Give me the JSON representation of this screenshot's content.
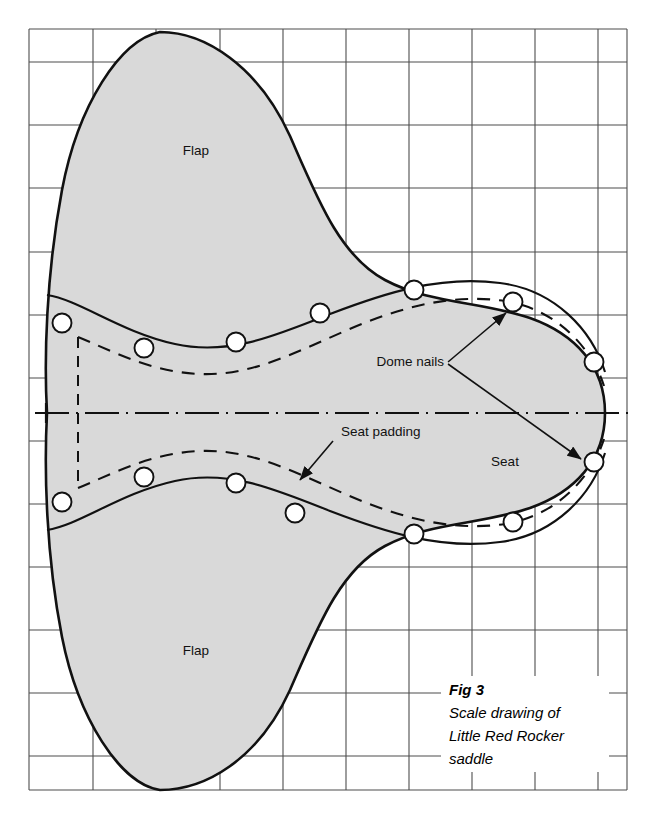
{
  "figure": {
    "caption_title": "Fig 3",
    "caption_lines": [
      "Scale drawing of",
      "Little Red Rocker",
      "saddle"
    ],
    "labels": {
      "flap_top": "Flap",
      "flap_bottom": "Flap",
      "seat": "Seat",
      "seat_padding": "Seat padding",
      "dome_nails": "Dome nails"
    },
    "colors": {
      "saddle_fill": "#d9d9d9",
      "outline": "#111111",
      "grid": "#4d4d4d",
      "text": "#111111",
      "background": "#ffffff"
    },
    "grid": {
      "x_lines": [
        29,
        93,
        156,
        220,
        283,
        346,
        409,
        472,
        535,
        598,
        627
      ],
      "y_lines": [
        29,
        62,
        125,
        188,
        252,
        315,
        378,
        441,
        504,
        567,
        630,
        693,
        756,
        790
      ],
      "left": 29,
      "right": 627,
      "top": 29,
      "bottom": 790,
      "cell_size": 63
    },
    "centerline_y": 413,
    "dome_nails": {
      "radius": 9,
      "count": 14,
      "upper": [
        {
          "cx": 62,
          "cy": 323
        },
        {
          "cx": 144,
          "cy": 348
        },
        {
          "cx": 236,
          "cy": 342
        },
        {
          "cx": 320,
          "cy": 313
        },
        {
          "cx": 414,
          "cy": 290
        },
        {
          "cx": 513,
          "cy": 302
        },
        {
          "cx": 594,
          "cy": 362
        }
      ],
      "lower": [
        {
          "cx": 62,
          "cy": 502
        },
        {
          "cx": 144,
          "cy": 477
        },
        {
          "cx": 236,
          "cy": 483
        },
        {
          "cx": 295,
          "cy": 513
        },
        {
          "cx": 414,
          "cy": 534
        },
        {
          "cx": 513,
          "cy": 522
        },
        {
          "cx": 594,
          "cy": 462
        }
      ]
    }
  }
}
